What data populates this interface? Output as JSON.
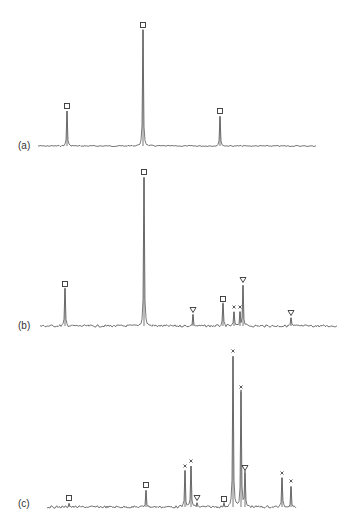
{
  "chart_data": {
    "type": "line",
    "title": "",
    "xlabel": "",
    "ylabel": "",
    "grid": false,
    "legend": "none",
    "marker_legend": {
      "square": "species marked with open square",
      "cross": "species marked with x",
      "triangle": "species marked with open down-triangle"
    },
    "panels": [
      {
        "label": "(a)",
        "baseline_y": 146,
        "x_range": [
          38,
          316
        ],
        "noise": 0.6,
        "peaks": [
          {
            "x": 67,
            "top": 111,
            "marker": "square"
          },
          {
            "x": 143,
            "top": 30,
            "marker": "square"
          },
          {
            "x": 220,
            "top": 116,
            "marker": "square"
          }
        ]
      },
      {
        "label": "(b)",
        "baseline_y": 326,
        "x_range": [
          40,
          337
        ],
        "noise": 1.2,
        "peaks": [
          {
            "x": 65,
            "top": 289,
            "marker": "square"
          },
          {
            "x": 144,
            "top": 177,
            "marker": "square"
          },
          {
            "x": 193,
            "top": 315,
            "marker": "triangle"
          },
          {
            "x": 223,
            "top": 304,
            "marker": "square"
          },
          {
            "x": 234,
            "top": 312,
            "marker": "cross"
          },
          {
            "x": 240,
            "top": 312,
            "marker": "cross"
          },
          {
            "x": 243,
            "top": 285,
            "marker": "triangle"
          },
          {
            "x": 291,
            "top": 318,
            "marker": "triangle"
          }
        ]
      },
      {
        "label": "(c)",
        "baseline_y": 507,
        "x_range": [
          47,
          296
        ],
        "noise": 1.2,
        "peaks": [
          {
            "x": 69,
            "top": 503,
            "marker": "square"
          },
          {
            "x": 146,
            "top": 490,
            "marker": "square"
          },
          {
            "x": 185,
            "top": 471,
            "marker": "cross"
          },
          {
            "x": 191,
            "top": 466,
            "marker": "cross"
          },
          {
            "x": 197,
            "top": 503,
            "marker": "triangle"
          },
          {
            "x": 224,
            "top": 504,
            "marker": "square"
          },
          {
            "x": 233,
            "top": 356,
            "marker": "cross"
          },
          {
            "x": 241,
            "top": 392,
            "marker": "cross"
          },
          {
            "x": 245,
            "top": 473,
            "marker": "triangle"
          },
          {
            "x": 282,
            "top": 478,
            "marker": "cross"
          },
          {
            "x": 291,
            "top": 486,
            "marker": "cross"
          }
        ]
      }
    ]
  },
  "colors": {
    "trace": "#555555",
    "marker": "#333333",
    "background": "#ffffff"
  }
}
